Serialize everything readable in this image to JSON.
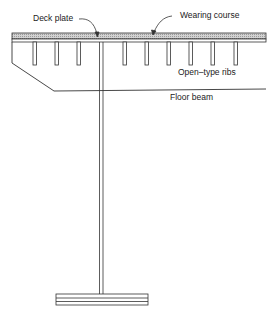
{
  "diagram": {
    "type": "structural cross-section",
    "labels": {
      "deck_plate": "Deck plate",
      "wearing_course": "Wearing course",
      "open_type_ribs": "Open–type ribs",
      "floor_beam": "Floor beam"
    },
    "components": [
      "wearing course",
      "deck plate",
      "open-type ribs",
      "floor beam",
      "web / stem",
      "bottom flange"
    ],
    "colors": {
      "line": "#333333",
      "wearing_course_fill": "#c8c8c8",
      "background": "#ffffff"
    }
  }
}
